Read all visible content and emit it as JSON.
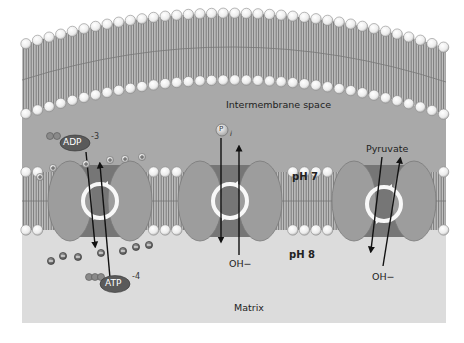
{
  "diagram": {
    "colors": {
      "background": "#ffffff",
      "intermembrane_space": "#a8a8a8",
      "matrix": "#dcdcdc",
      "lipid_tail": "#8a8a8a",
      "lipid_head": "#f2f2f2",
      "transporter": "#9a9a9a",
      "transporter_channel": "#6e6e6e",
      "molecule_dark": "#5a5a5a"
    },
    "regions": {
      "intermembrane_space": "Intermembrane space",
      "matrix": "Matrix"
    },
    "ph_labels": {
      "outer": "pH 7",
      "inner": "pH 8"
    },
    "transporters": [
      {
        "name": "ADP/ATP translocase",
        "in_molecule": "ADP",
        "in_charge": "-3",
        "out_molecule": "ATP",
        "out_charge": "-4"
      },
      {
        "name": "Phosphate translocase",
        "in_molecule": "P",
        "in_subscript": "i",
        "out_molecule": "OH−"
      },
      {
        "name": "Pyruvate carrier",
        "in_molecule": "Pyruvate",
        "out_molecule": "OH−"
      }
    ],
    "charges": {
      "positive_symbol": "+",
      "negative_symbol": "−"
    }
  }
}
